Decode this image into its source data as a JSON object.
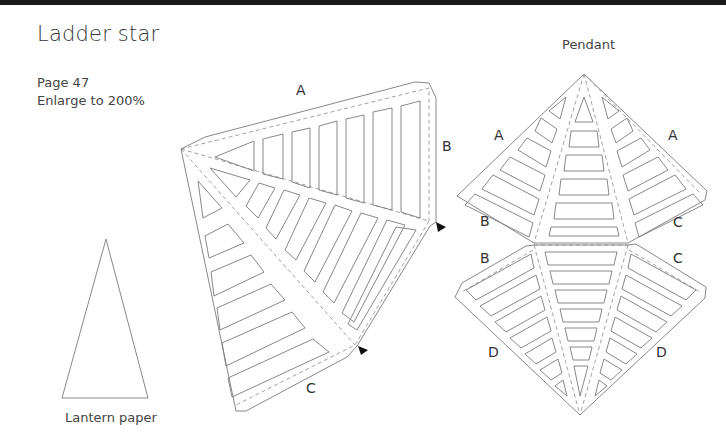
{
  "page": {
    "title": "Ladder star",
    "page_ref": "Page 47",
    "instruction": "Enlarge to 200%"
  },
  "lantern_template": {
    "caption": "Lantern paper"
  },
  "star_template": {
    "edge_labels": {
      "top": "A",
      "right": "B",
      "bottom": "C"
    }
  },
  "pendant_template": {
    "caption": "Pendant",
    "upper_labels": {
      "left_top": "A",
      "right_top": "A",
      "left_bottom": "B",
      "right_bottom": "C"
    },
    "lower_labels": {
      "left_top": "B",
      "right_top": "C",
      "left_bottom": "D",
      "right_bottom": "D"
    }
  },
  "colors": {
    "background": "#ffffff",
    "line": "#7a7a7a",
    "text": "#333333",
    "marker": "#111111"
  }
}
